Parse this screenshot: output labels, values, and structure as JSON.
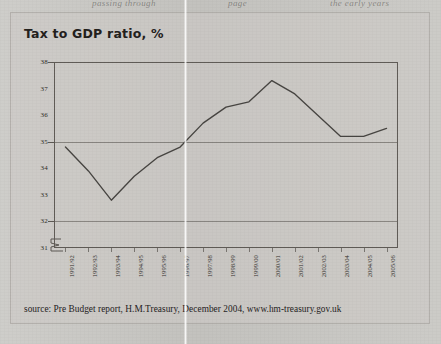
{
  "page": {
    "bleed_text_left": "passing through",
    "bleed_text_mid": "page",
    "bleed_text_right": "the early years"
  },
  "figure": {
    "title": "Tax to GDP ratio, %",
    "source": "source: Pre Budget report, H.M.Treasury, December 2004, www.hm-treasury.gov.uk"
  },
  "chart_data": {
    "type": "line",
    "title": "Tax to GDP ratio, %",
    "xlabel": "",
    "ylabel": "",
    "ylim": [
      31,
      38
    ],
    "yticks": [
      31,
      32,
      33,
      34,
      35,
      36,
      37,
      38
    ],
    "ytick_labels": [
      "31",
      "32",
      "33",
      "34",
      "35",
      "36",
      "37",
      "38"
    ],
    "gridlines": [
      32,
      35
    ],
    "grid": true,
    "axis_break": true,
    "legend": "none",
    "categories": [
      "1991/92",
      "1992/93",
      "1993/94",
      "1994/95",
      "1995/96",
      "1996/97",
      "1997/98",
      "1998/99",
      "1999/00",
      "2000/01",
      "2001/02",
      "2002/03",
      "2003/04",
      "2004/05",
      "2005/06"
    ],
    "values": [
      34.8,
      33.9,
      32.8,
      33.7,
      34.4,
      34.8,
      35.7,
      36.3,
      36.5,
      37.3,
      36.8,
      36.0,
      35.2,
      35.2,
      35.5
    ],
    "series": [
      {
        "name": "Tax to GDP ratio",
        "values": [
          34.8,
          33.9,
          32.8,
          33.7,
          34.4,
          34.8,
          35.7,
          36.3,
          36.5,
          37.3,
          36.8,
          36.0,
          35.2,
          35.2,
          35.5
        ]
      }
    ],
    "colors": {
      "line": "#3c3936",
      "frame": "#605c57",
      "background": "#cdcbc7",
      "text": "#25221e"
    }
  }
}
